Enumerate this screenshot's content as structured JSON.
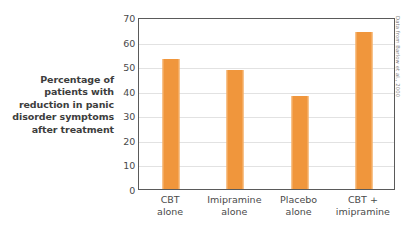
{
  "chart_data": {
    "type": "bar",
    "title": "",
    "xlabel": "",
    "ylabel": "Percentage of patients with reduction in panic disorder symptoms after treatment",
    "ylabel_lines": [
      "Percentage of",
      "patients with",
      "reduction in panic",
      "disorder symptoms",
      "after treatment"
    ],
    "categories": [
      "CBT alone",
      "Imipramine alone",
      "Placebo alone",
      "CBT + imipramine"
    ],
    "category_lines": [
      [
        "CBT",
        "alone"
      ],
      [
        "Imipramine",
        "alone"
      ],
      [
        "Placebo",
        "alone"
      ],
      [
        "CBT +",
        "imipramine"
      ]
    ],
    "values": [
      53,
      48.5,
      38,
      64
    ],
    "ylim": [
      0,
      70
    ],
    "yticks": [
      0,
      10,
      20,
      30,
      40,
      50,
      60,
      70
    ],
    "ytick_labels": [
      "0",
      "10",
      "20",
      "30",
      "40",
      "50",
      "60",
      "70"
    ],
    "grid": true,
    "legend": false,
    "bar_color": "#f0963c",
    "bar_edge_color": "#f8bb7e",
    "gridline_color": "#e2e2e2",
    "frame_color": "#5a5a5a",
    "background": "#ffffff"
  },
  "source_note": "Data from Barlow et al., 2000"
}
